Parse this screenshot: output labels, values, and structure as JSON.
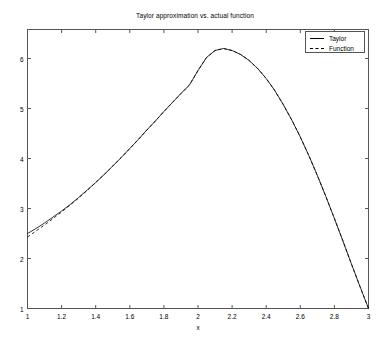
{
  "chart_data": {
    "type": "line",
    "title": "Taylor approximation vs. actual function",
    "xlabel": "x",
    "ylabel": "",
    "xlim": [
      1,
      3
    ],
    "ylim": [
      1,
      6.58
    ],
    "grid": false,
    "legend_position": "top-right",
    "xticks": [
      1,
      1.2,
      1.4,
      1.6,
      1.8,
      2,
      2.2,
      2.4,
      2.6,
      2.8,
      3
    ],
    "xtick_labels": [
      "1",
      "1.2",
      "1.4",
      "1.6",
      "1.8",
      "2",
      "2.2",
      "2.4",
      "2.6",
      "2.8",
      "3"
    ],
    "yticks": [
      1,
      2,
      3,
      4,
      5,
      6
    ],
    "ytick_labels": [
      "1",
      "2",
      "3",
      "4",
      "5",
      "6"
    ],
    "x": [
      1,
      1.05,
      1.1,
      1.15,
      1.2,
      1.25,
      1.3,
      1.35,
      1.4,
      1.45,
      1.5,
      1.55,
      1.6,
      1.65,
      1.7,
      1.75,
      1.8,
      1.85,
      1.9,
      1.95,
      2,
      2.05,
      2.1,
      2.15,
      2.2,
      2.25,
      2.3,
      2.35,
      2.4,
      2.45,
      2.5,
      2.55,
      2.6,
      2.65,
      2.7,
      2.75,
      2.8,
      2.85,
      2.9,
      2.95,
      3
    ],
    "series": [
      {
        "name": "Taylor",
        "style": "solid",
        "color": "#000000",
        "values": [
          2.5,
          2.6,
          2.71,
          2.83,
          2.95,
          3.08,
          3.22,
          3.37,
          3.52,
          3.68,
          3.85,
          4.02,
          4.2,
          4.38,
          4.57,
          4.75,
          4.94,
          5.12,
          5.3,
          5.47,
          5.76,
          6.02,
          6.16,
          6.2,
          6.16,
          6.08,
          5.96,
          5.8,
          5.6,
          5.36,
          5.08,
          4.77,
          4.43,
          4.06,
          3.66,
          3.24,
          2.8,
          2.35,
          1.89,
          1.44,
          1.0
        ]
      },
      {
        "name": "Function",
        "style": "dashed",
        "color": "#000000",
        "values": [
          2.43,
          2.55,
          2.67,
          2.8,
          2.93,
          3.07,
          3.21,
          3.36,
          3.52,
          3.68,
          3.85,
          4.02,
          4.2,
          4.38,
          4.57,
          4.75,
          4.94,
          5.12,
          5.3,
          5.47,
          5.76,
          6.02,
          6.16,
          6.2,
          6.16,
          6.08,
          5.96,
          5.8,
          5.6,
          5.36,
          5.08,
          4.77,
          4.43,
          4.06,
          3.66,
          3.24,
          2.8,
          2.35,
          1.89,
          1.44,
          1.0
        ]
      }
    ]
  },
  "legend": {
    "entries": [
      {
        "label": "Taylor"
      },
      {
        "label": "Function"
      }
    ]
  }
}
